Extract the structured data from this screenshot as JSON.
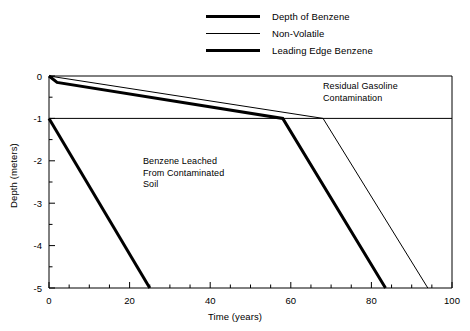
{
  "chart_data": {
    "type": "line",
    "title": "",
    "xlabel": "Time (years)",
    "ylabel": "Depth (meters)",
    "xlim": [
      0,
      100
    ],
    "ylim": [
      -5,
      0
    ],
    "xticks": [
      0,
      20,
      40,
      60,
      80,
      100
    ],
    "xtick_labels": [
      "0",
      "20",
      "40",
      "60",
      "80",
      "100"
    ],
    "xminor_step": 5,
    "yticks": [
      0,
      -1,
      -2,
      -3,
      -4,
      -5
    ],
    "ytick_labels": [
      "0",
      "-1",
      "-2",
      "-3",
      "-4",
      "-5"
    ],
    "yminor_step": 0.5,
    "grid": false,
    "legend_position": "top-center",
    "series": [
      {
        "name": "Depth of Benzene",
        "style": "thick",
        "color": "#000000",
        "width_px": 3,
        "points": [
          [
            0,
            0
          ],
          [
            2,
            -0.15
          ],
          [
            58,
            -1
          ],
          [
            83.5,
            -5
          ]
        ]
      },
      {
        "name": "Non-Volatile",
        "style": "thin",
        "color": "#000000",
        "width_px": 1,
        "points": [
          [
            0,
            0
          ],
          [
            68,
            -1
          ],
          [
            94,
            -5
          ]
        ]
      },
      {
        "name": "Leading Edge Benzene",
        "style": "thick",
        "color": "#000000",
        "width_px": 3,
        "points": [
          [
            0,
            -1
          ],
          [
            25,
            -5
          ]
        ]
      }
    ],
    "reference_lines": [
      {
        "name": "water-table-line",
        "orientation": "horizontal",
        "y": -1,
        "color": "#000000",
        "width_px": 1
      },
      {
        "name": "ground-surface-line",
        "orientation": "horizontal",
        "y": 0,
        "color": "#000000",
        "width_px": 1
      },
      {
        "name": "right-boundary-line",
        "orientation": "vertical",
        "x": 100,
        "color": "#000000",
        "width_px": 1
      }
    ],
    "annotations": [
      {
        "name": "residual-gasoline-contamination",
        "text": "Residual Gasoline\nContamination",
        "x": 68,
        "y": -0.15
      },
      {
        "name": "benzene-leached-from-contaminated-soil",
        "text": "Benzene Leached\nFrom Contaminated\nSoil",
        "x": 23,
        "y": -1.9
      }
    ]
  },
  "legend": {
    "items": [
      {
        "label": "Depth of Benzene",
        "style": "thick"
      },
      {
        "label": "Non-Volatile",
        "style": "thin"
      },
      {
        "label": "Leading Edge Benzene",
        "style": "thick"
      }
    ]
  },
  "axes": {
    "x_title": "Time (years)",
    "y_title": "Depth (meters)",
    "x_tick_labels": [
      "0",
      "20",
      "40",
      "60",
      "80",
      "100"
    ],
    "y_tick_labels": [
      "0",
      "-1",
      "-2",
      "-3",
      "-4",
      "-5"
    ]
  },
  "annotations": {
    "residual": "Residual Gasoline\nContamination",
    "leached": "Benzene Leached\nFrom Contaminated\nSoil"
  },
  "colors": {
    "line": "#000000",
    "axis": "#000000",
    "background": "#ffffff"
  }
}
